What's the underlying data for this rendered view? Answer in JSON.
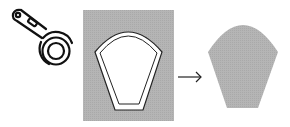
{
  "diagram": {
    "tool": {
      "name": "rotary-cutter"
    },
    "panel": {
      "fill": "#b3b3b3"
    },
    "template_outline": {
      "stroke": "#1a1a1a",
      "fill": "#ffffff"
    },
    "result_shape": {
      "fill": "#b0b0b0"
    },
    "arrow": {
      "direction": "right"
    },
    "colors": {
      "background": "#ffffff",
      "fabric": "#b3b3b3",
      "ink": "#111111"
    }
  }
}
